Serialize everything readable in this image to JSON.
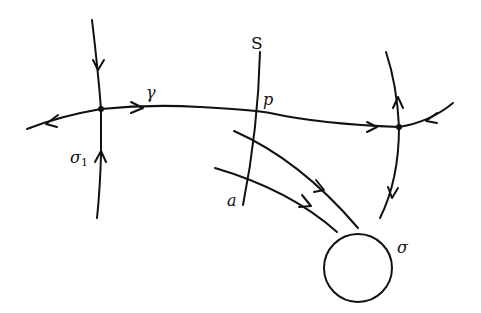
{
  "diagram": {
    "type": "phase-portrait",
    "labels": {
      "section": "S",
      "point_p": "p",
      "point_a": "a",
      "orbit_gamma": "γ",
      "saddle_left": "σ",
      "saddle_left_sub": "1",
      "attractor": "σ"
    },
    "colors": {
      "stroke": "#111111",
      "background": "#ffffff"
    },
    "elements": [
      {
        "id": "saddle-left",
        "kind": "saddle point",
        "label": "σ1"
      },
      {
        "id": "saddle-right",
        "kind": "saddle point"
      },
      {
        "id": "connecting-orbit",
        "kind": "heteroclinic orbit",
        "label": "γ"
      },
      {
        "id": "cross-section",
        "kind": "transversal section",
        "label": "S",
        "points": [
          "p",
          "a"
        ]
      },
      {
        "id": "attractor",
        "kind": "closed orbit / attractor",
        "label": "σ"
      }
    ]
  }
}
